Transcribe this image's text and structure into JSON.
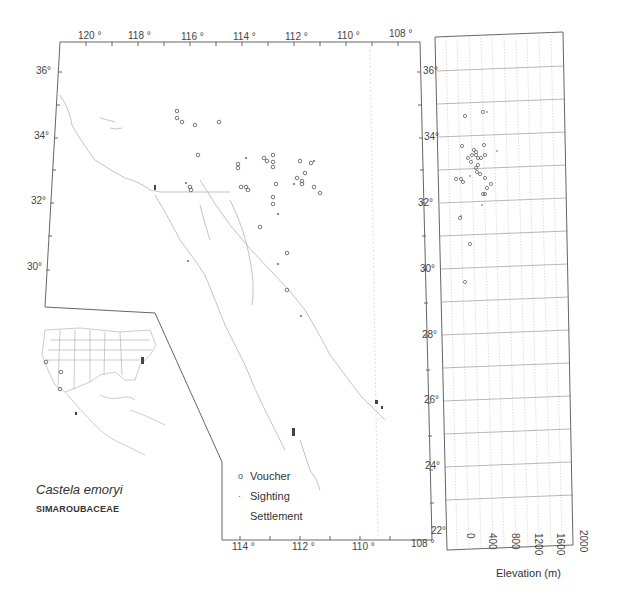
{
  "figure": {
    "species": "Castela emoryi",
    "family": "SIMAROUBACEAE"
  },
  "main_map": {
    "top_lon_labels": [
      "120 °",
      "118 °",
      "116 °",
      "114 °",
      "112 °",
      "110 °",
      "108 °"
    ],
    "bottom_lon_labels": [
      "114 °",
      "112 °",
      "110 °",
      "108 °"
    ],
    "left_lat_labels": [
      "36°",
      "34°",
      "32°",
      "30°"
    ],
    "right_lat_labels": [
      "36°",
      "34°",
      "32°",
      "30°",
      "28°",
      "26°",
      "24°",
      "22°"
    ]
  },
  "legend": {
    "items": [
      {
        "symbol": "o",
        "label": "Voucher"
      },
      {
        "symbol": "·",
        "label": "Sighting"
      },
      {
        "symbol": "",
        "label": "Settlement"
      }
    ]
  },
  "elevation_panel": {
    "x_ticks": [
      "0",
      "400",
      "800",
      "1200",
      "1600",
      "2000"
    ],
    "x_label": "Elevation (m)"
  },
  "colors": {
    "frame": "#555555",
    "grid": "#bbbbbb",
    "coast": "#aaaaaa",
    "marker": "#555555"
  }
}
